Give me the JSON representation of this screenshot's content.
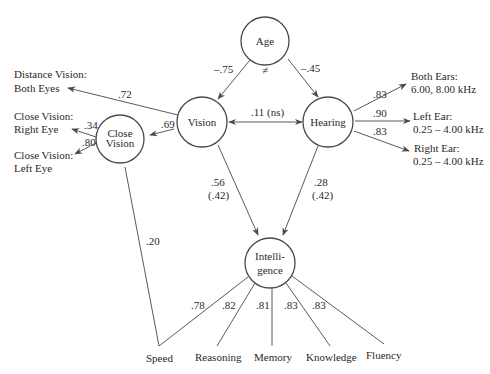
{
  "diagram": {
    "type": "structural-equation-model",
    "nodes": {
      "age": {
        "label": "Age"
      },
      "vision": {
        "label": "Vision"
      },
      "hearing": {
        "label": "Hearing"
      },
      "close_vision": {
        "label_line1": "Close",
        "label_line2": "Vision"
      },
      "intelligence": {
        "label_line1": "Intelli-",
        "label_line2": "gence"
      }
    },
    "indicators": {
      "distance_vision": {
        "line1": "Distance Vision:",
        "line2": "Both Eyes"
      },
      "close_vision_right": {
        "line1": "Close Vision:",
        "line2": "Right Eye"
      },
      "close_vision_left": {
        "line1": "Close Vision:",
        "line2": "Left Eye"
      },
      "both_ears": {
        "line1": "Both Ears:",
        "line2": "6.00, 8.00 kHz"
      },
      "left_ear": {
        "line1": "Left Ear:",
        "line2": "0.25 – 4.00 kHz"
      },
      "right_ear": {
        "line1": "Right Ear:",
        "line2": "0.25 – 4.00 kHz"
      },
      "speed": "Speed",
      "reasoning": "Reasoning",
      "memory": "Memory",
      "knowledge": "Knowledge",
      "fluency": "Fluency"
    },
    "coefficients": {
      "age_vision": "–.75",
      "age_hearing": "–.45",
      "age_neq": "≠",
      "vision_hearing": ".11 (ns)",
      "vision_distance": ".72",
      "vision_close": ".69",
      "close_right": ".34",
      "close_left": ".80",
      "close_speed": ".20",
      "hearing_both": ".83",
      "hearing_left": ".90",
      "hearing_right": ".83",
      "vision_intel": ".56",
      "vision_intel_paren": "(.42)",
      "hearing_intel": ".28",
      "hearing_intel_paren": "(.42)",
      "intel_speed": ".78",
      "intel_reasoning": ".82",
      "intel_memory": ".81",
      "intel_knowledge": ".83",
      "intel_fluency": ".83"
    }
  }
}
